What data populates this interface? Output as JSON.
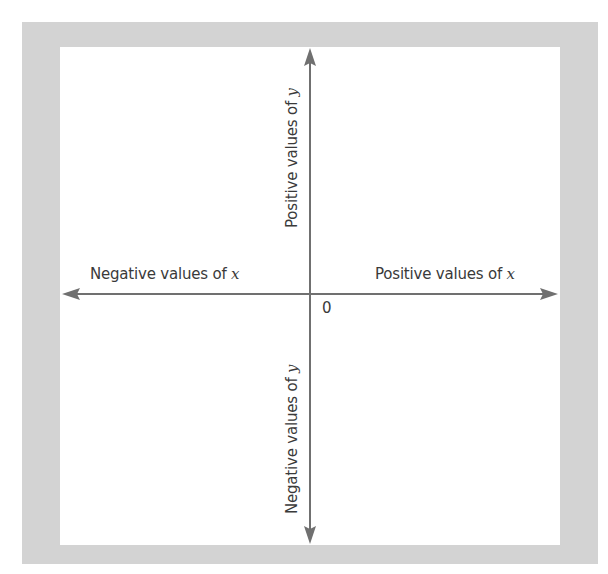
{
  "diagram": {
    "type": "cartesian-axes",
    "origin_label": "0",
    "labels": {
      "positive_x": {
        "text": "Positive values of ",
        "var": "x"
      },
      "negative_x": {
        "text": "Negative values of ",
        "var": "x"
      },
      "positive_y": {
        "text": "Positive values of ",
        "var": "y"
      },
      "negative_y": {
        "text": "Negative values of ",
        "var": "y"
      }
    },
    "colors": {
      "frame": "#d3d3d3",
      "panel": "#ffffff",
      "axis": "#707070",
      "text": "#3a3a3a"
    }
  }
}
